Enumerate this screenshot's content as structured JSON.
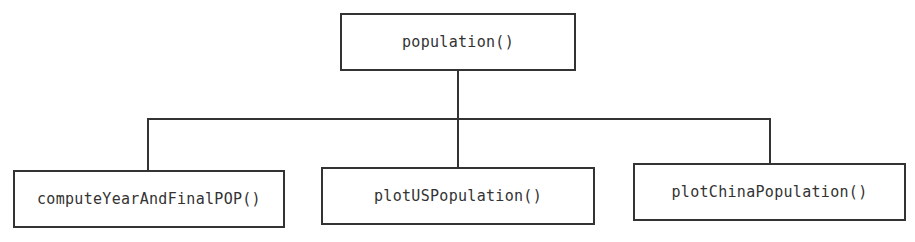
{
  "diagram": {
    "type": "function-call-hierarchy",
    "root": {
      "id": "population",
      "label": "population()"
    },
    "children": [
      {
        "id": "computeYearAndFinalPOP",
        "label": "computeYearAndFinalPOP()"
      },
      {
        "id": "plotUSPopulation",
        "label": "plotUSPopulation()"
      },
      {
        "id": "plotChinaPopulation",
        "label": "plotChinaPopulation()"
      }
    ],
    "edges": [
      {
        "from": "population",
        "to": "computeYearAndFinalPOP"
      },
      {
        "from": "population",
        "to": "plotUSPopulation"
      },
      {
        "from": "population",
        "to": "plotChinaPopulation"
      }
    ],
    "colors": {
      "stroke": "#333333",
      "text": "#333333",
      "background": "#ffffff"
    }
  }
}
